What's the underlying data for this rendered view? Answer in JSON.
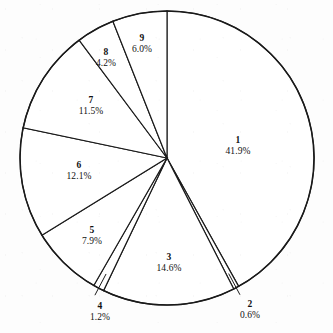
{
  "chart_data": {
    "type": "pie",
    "title": "",
    "subtitle": "",
    "xlabel": "",
    "ylabel": "",
    "legend_position": "none",
    "grid": false,
    "labels_show_percent": true,
    "start_angle_deg": 0,
    "direction": "clockwise",
    "categories": [
      "1",
      "2",
      "3",
      "4",
      "5",
      "6",
      "7",
      "8",
      "9"
    ],
    "values": [
      41.9,
      0.6,
      14.6,
      1.2,
      7.9,
      12.1,
      11.5,
      4.2,
      6.0
    ],
    "slices": [
      {
        "name": "1",
        "value": 41.9,
        "value_text": "41.9%",
        "label_x": 238,
        "label_y": 146,
        "leader": false
      },
      {
        "name": "2",
        "value": 0.6,
        "value_text": "0.6%",
        "label_x": 250,
        "label_y": 310,
        "leader": true
      },
      {
        "name": "3",
        "value": 14.6,
        "value_text": "14.6%",
        "label_x": 169,
        "label_y": 263,
        "leader": false
      },
      {
        "name": "4",
        "value": 1.2,
        "value_text": "1.2%",
        "label_x": 100,
        "label_y": 312,
        "leader": true
      },
      {
        "name": "5",
        "value": 7.9,
        "value_text": "7.9%",
        "label_x": 92,
        "label_y": 236,
        "leader": false
      },
      {
        "name": "6",
        "value": 12.1,
        "value_text": "12.1%",
        "label_x": 79,
        "label_y": 171,
        "leader": false
      },
      {
        "name": "7",
        "value": 11.5,
        "value_text": "11.5%",
        "label_x": 91,
        "label_y": 106,
        "leader": false
      },
      {
        "name": "8",
        "value": 4.2,
        "value_text": "4.2%",
        "label_x": 106,
        "label_y": 58,
        "leader": false
      },
      {
        "name": "9",
        "value": 6.0,
        "value_text": "6.0%",
        "label_x": 142,
        "label_y": 44,
        "leader": false
      }
    ],
    "geometry": {
      "center_x": 167,
      "center_y": 158,
      "radius": 147
    },
    "colors": {
      "slice_fill": "#ffffff",
      "slice_stroke": "#1a1a1a",
      "background": "#fdfdfd",
      "text": "#111111"
    }
  }
}
